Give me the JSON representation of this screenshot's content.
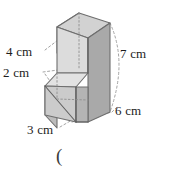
{
  "figure": {
    "caption_fragment": "(",
    "shape_name": "step-shaped-solid",
    "unit": "cm",
    "faces": {
      "top_fill": "#cfcfcf",
      "upper_front_fill": "#d9d9d9",
      "upper_left_fill": "#c4c4c4",
      "right_side_fill": "#a8a8a8",
      "step_top_fill": "#e0e0e0",
      "step_front_fill": "#c9c9c9",
      "step_left_fill": "#b8b8b8",
      "outline": "#6e6e6e",
      "hidden_edge": "#9a9a9a",
      "leader": "#8a8a8a"
    },
    "labels": [
      {
        "id": "label-4cm",
        "text": "4 cm",
        "measures": "upper-block-height"
      },
      {
        "id": "label-2cm",
        "text": "2 cm",
        "measures": "step-height"
      },
      {
        "id": "label-7cm",
        "text": "7 cm",
        "measures": "total-height"
      },
      {
        "id": "label-6cm",
        "text": "6 cm",
        "measures": "depth"
      },
      {
        "id": "label-3cm",
        "text": "3 cm",
        "measures": "width"
      }
    ],
    "dimensions": {
      "upper_height": "4 cm",
      "step_height": "2 cm",
      "total_height": "7 cm",
      "depth": "6 cm",
      "width": "3 cm"
    }
  }
}
